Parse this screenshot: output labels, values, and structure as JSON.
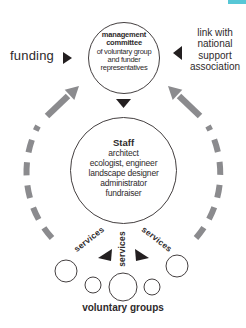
{
  "labels": {
    "funding": "funding",
    "voluntary_groups": "voluntary groups"
  },
  "link": {
    "lines": [
      "link with",
      "national",
      "support",
      "association"
    ]
  },
  "services": {
    "left": "services",
    "middle": "services",
    "right": "services"
  },
  "management_committee": {
    "title_line1": "management",
    "title_line2": "committee",
    "lines": [
      "of voluntary group",
      "and funder",
      "representatives"
    ]
  },
  "staff": {
    "title": "Staff",
    "lines": [
      "architect",
      "ecologist, engineer",
      "landscape designer",
      "administrator",
      "fundraiser"
    ]
  },
  "colors": {
    "text": "#2e2a2b",
    "arrow_gray": "#8b8b8e",
    "circle_stroke": "#443f40",
    "accent_teal": "#57c7d6"
  }
}
